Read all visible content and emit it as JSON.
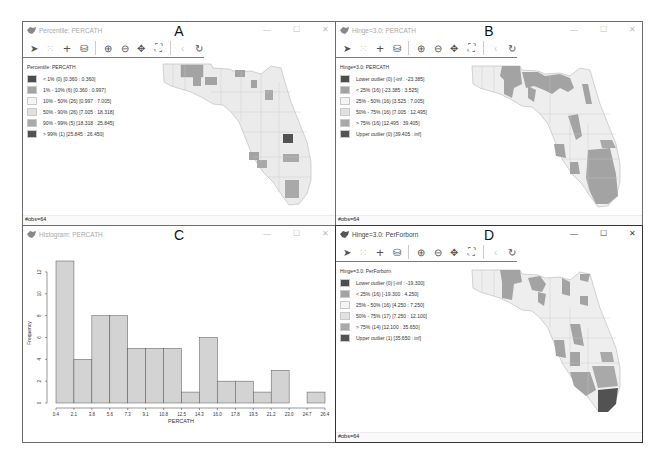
{
  "panels": {
    "A": {
      "letter": "A",
      "title": "Percentile: PERCATH",
      "legend_title": "Percentile: PERCATH",
      "legend": [
        {
          "label": "< 1% (0)  [0.360 : 0.360]",
          "color": "#4d4d4d"
        },
        {
          "label": "1% - 10% (6)  [0.360 : 0.997]",
          "color": "#a3a3a3"
        },
        {
          "label": "10% - 50% (26)  [0.997 : 7.005]",
          "color": "#f4f4f4"
        },
        {
          "label": "50% - 90% (26)  [7.005 : 18.318]",
          "color": "#e2e2e2"
        },
        {
          "label": "90% - 99% (5)  [18.318 : 25.845]",
          "color": "#a9a9a9"
        },
        {
          "label": "> 99% (1)  [25.845 : 26.450]",
          "color": "#525252"
        }
      ],
      "status": "#obs=64"
    },
    "B": {
      "letter": "B",
      "title": "Hinge=3.0: PERCATH",
      "legend_title": "Hinge=3.0: PERCATH",
      "legend": [
        {
          "label": "Lower outlier (0)  [-inf : -23.385]",
          "color": "#4d4d4d"
        },
        {
          "label": "< 25% (16)  [-23.385 : 3.525]",
          "color": "#a3a3a3"
        },
        {
          "label": "25% - 50% (16)  [3.525 : 7.005]",
          "color": "#f4f4f4"
        },
        {
          "label": "50% - 75% (16)  [7.005 : 12.495]",
          "color": "#e2e2e2"
        },
        {
          "label": "> 75% (16)  [12.495 : 39.405]",
          "color": "#a9a9a9"
        },
        {
          "label": "Upper outlier (0)  [39.405 : inf]",
          "color": "#525252"
        }
      ],
      "status": "#obs=64"
    },
    "C": {
      "letter": "C",
      "title": "Histogram: PERCATH"
    },
    "D": {
      "letter": "D",
      "title": "Hinge=3.0: PerForborn",
      "legend_title": "Hinge=3.0: PerForborn",
      "legend": [
        {
          "label": "Lower outlier (0)  [-inf : -19.300]",
          "color": "#4d4d4d"
        },
        {
          "label": "< 25% (16)  [-19.300 : 4.250]",
          "color": "#a3a3a3"
        },
        {
          "label": "25% - 50% (16)  [4.250 : 7.250]",
          "color": "#f4f4f4"
        },
        {
          "label": "50% - 75% (17)  [7.250 : 12.100]",
          "color": "#e2e2e2"
        },
        {
          "label": "> 75% (14)  [12.100 : 35.650]",
          "color": "#a9a9a9"
        },
        {
          "label": "Upper outlier (1)  [35.650 : inf]",
          "color": "#525252"
        }
      ],
      "status": "#obs=64"
    }
  },
  "window_controls": {
    "minimize": "—",
    "maximize": "☐",
    "close": "✕"
  },
  "toolbar_icons": [
    "select-arrow-icon",
    "brush-icon",
    "crosshair-plus-icon",
    "layers-icon",
    "zoom-in-icon",
    "zoom-out-icon",
    "pan-icon",
    "fit-extent-icon",
    "back-icon",
    "refresh-icon"
  ],
  "chart_data": {
    "type": "bar",
    "title": "Histogram: PERCATH",
    "xlabel": "PERCATH",
    "ylabel": "Frequency",
    "bin_edges": [
      0.4,
      2.1,
      3.8,
      5.6,
      7.3,
      9.1,
      10.8,
      12.5,
      14.3,
      16.0,
      17.8,
      19.5,
      21.2,
      23.0,
      24.7,
      26.4
    ],
    "x_tick_labels": [
      "0.4",
      "2.1",
      "3.8",
      "5.6",
      "7.3",
      "9.1",
      "10.8",
      "12.5",
      "14.3",
      "16.0",
      "17.8",
      "19.5",
      "21.2",
      "23.0",
      "24.7",
      "26.4"
    ],
    "values": [
      13,
      4,
      8,
      8,
      5,
      5,
      5,
      1,
      6,
      2,
      2,
      1,
      3,
      0,
      1
    ],
    "y_ticks": [
      "0",
      "2",
      "4",
      "6",
      "8",
      "10",
      "12"
    ],
    "ylim": [
      0,
      13
    ],
    "grid": false,
    "bar_color": "#d3d3d3"
  }
}
